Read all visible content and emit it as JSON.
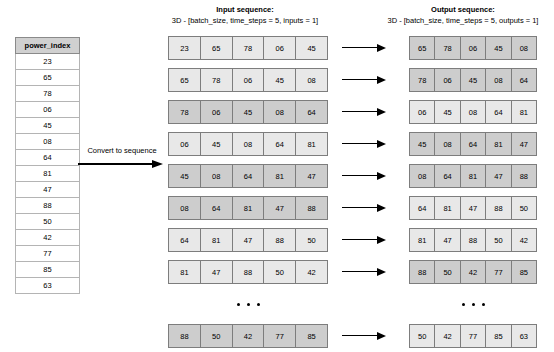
{
  "table": {
    "header": "power_index",
    "values": [
      "23",
      "65",
      "78",
      "06",
      "45",
      "08",
      "64",
      "81",
      "47",
      "88",
      "50",
      "42",
      "77",
      "85",
      "63"
    ]
  },
  "convert": {
    "label": "Convert to sequence",
    "arrow_icon": "right-arrow-icon"
  },
  "input_section": {
    "title": "Input sequence:",
    "subtitle": "3D - [batch_size, time_steps = 5, inputs = 1]",
    "rows": [
      {
        "shade": "light",
        "cells": [
          "23",
          "65",
          "78",
          "06",
          "45"
        ]
      },
      {
        "shade": "light",
        "cells": [
          "65",
          "78",
          "06",
          "45",
          "08"
        ]
      },
      {
        "shade": "dark",
        "cells": [
          "78",
          "06",
          "45",
          "08",
          "64"
        ]
      },
      {
        "shade": "light",
        "cells": [
          "06",
          "45",
          "08",
          "64",
          "81"
        ]
      },
      {
        "shade": "dark",
        "cells": [
          "45",
          "08",
          "64",
          "81",
          "47"
        ]
      },
      {
        "shade": "dark",
        "cells": [
          "08",
          "64",
          "81",
          "47",
          "88"
        ]
      },
      {
        "shade": "light",
        "cells": [
          "64",
          "81",
          "47",
          "88",
          "50"
        ]
      },
      {
        "shade": "light",
        "cells": [
          "81",
          "47",
          "88",
          "50",
          "42"
        ]
      },
      {
        "shade": "ellipsis",
        "cells": []
      },
      {
        "shade": "dark",
        "cells": [
          "88",
          "50",
          "42",
          "77",
          "85"
        ]
      }
    ]
  },
  "output_section": {
    "title": "Output sequence:",
    "subtitle": "3D - [batch_size, time_steps = 5, outputs = 1]",
    "rows": [
      {
        "shade": "dark",
        "cells": [
          "65",
          "78",
          "06",
          "45",
          "08"
        ]
      },
      {
        "shade": "dark",
        "cells": [
          "78",
          "06",
          "45",
          "08",
          "64"
        ]
      },
      {
        "shade": "light",
        "cells": [
          "06",
          "45",
          "08",
          "64",
          "81"
        ]
      },
      {
        "shade": "dark",
        "cells": [
          "45",
          "08",
          "64",
          "81",
          "47"
        ]
      },
      {
        "shade": "dark",
        "cells": [
          "08",
          "64",
          "81",
          "47",
          "88"
        ]
      },
      {
        "shade": "light",
        "cells": [
          "64",
          "81",
          "47",
          "88",
          "50"
        ]
      },
      {
        "shade": "light",
        "cells": [
          "81",
          "47",
          "88",
          "50",
          "42"
        ]
      },
      {
        "shade": "dark",
        "cells": [
          "88",
          "50",
          "42",
          "77",
          "85"
        ]
      },
      {
        "shade": "ellipsis",
        "cells": []
      },
      {
        "shade": "light",
        "cells": [
          "50",
          "42",
          "77",
          "85",
          "63"
        ]
      }
    ]
  },
  "connector_arrows": {
    "icon": "right-arrow-icon",
    "count": 9,
    "slots": [
      "arrow",
      "arrow",
      "arrow",
      "arrow",
      "arrow",
      "arrow",
      "arrow",
      "arrow",
      "blank",
      "arrow"
    ]
  },
  "colors": {
    "row_light": "#e8e8e8",
    "row_dark": "#cdcdcd",
    "border": "#7d7d7d",
    "table_header": "#d0d0d0",
    "text": "#000000"
  }
}
